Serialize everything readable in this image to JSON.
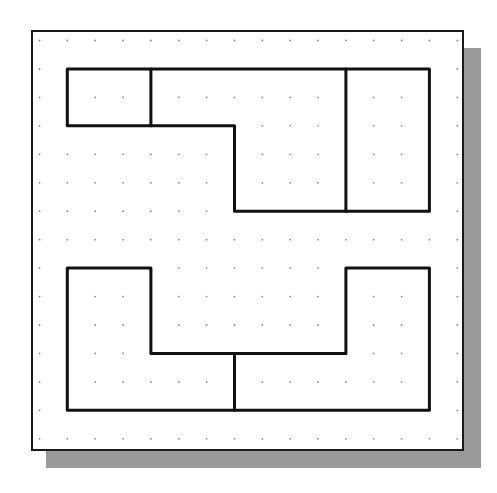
{
  "diagram": {
    "title": "",
    "colors": {
      "background": "#ffffff",
      "frame": "#1a1a1a",
      "shape_stroke": "#111111",
      "grid_dot": "#8a8a8a",
      "shadow": "#9a9a9a"
    },
    "frame": {
      "x": 32,
      "y": 31,
      "width": 431,
      "height": 419
    },
    "shadow": {
      "offset_x": 17,
      "offset_y": 17
    },
    "grid": {
      "origin_x": 39.5,
      "origin_y": 40.5,
      "step_x": 27.85,
      "step_y": 28.45,
      "columns": 16,
      "rows": 15
    },
    "shapes": [
      {
        "name": "top-shape",
        "outline_cells": [
          [
            1,
            1
          ],
          [
            14,
            1
          ],
          [
            14,
            6
          ],
          [
            7,
            6
          ],
          [
            7,
            3
          ],
          [
            1,
            3
          ]
        ],
        "dividers": [
          [
            [
              4,
              1
            ],
            [
              4,
              3
            ]
          ],
          [
            [
              11,
              1
            ],
            [
              11,
              6
            ]
          ]
        ],
        "regions": [
          "top-left-square",
          "top-middle-step-region",
          "top-right-rectangle"
        ]
      },
      {
        "name": "bottom-shape",
        "outline_cells": [
          [
            1,
            8
          ],
          [
            4,
            8
          ],
          [
            4,
            11
          ],
          [
            11,
            11
          ],
          [
            11,
            8
          ],
          [
            14,
            8
          ],
          [
            14,
            13
          ],
          [
            1,
            13
          ]
        ],
        "dividers": [
          [
            [
              7,
              11
            ],
            [
              7,
              13
            ]
          ]
        ],
        "regions": [
          "bottom-left-L-region",
          "bottom-right-L-region"
        ]
      }
    ]
  }
}
